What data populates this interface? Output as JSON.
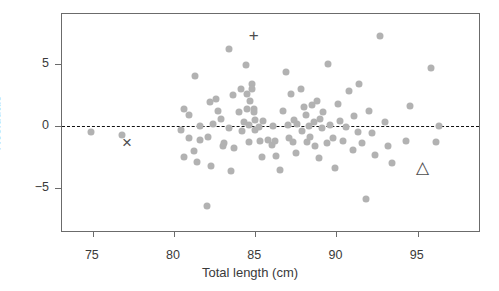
{
  "chart_data": {
    "type": "scatter",
    "title": "",
    "xlabel": "Total length (cm)",
    "ylabel": "Residuals",
    "xlim": [
      73.1,
      98.9
    ],
    "ylim": [
      -8.6,
      9.0
    ],
    "xticks": [
      75,
      80,
      85,
      90,
      95
    ],
    "xticklabels": [
      "75",
      "80",
      "85",
      "90",
      "95"
    ],
    "yticks": [
      5,
      0,
      -5
    ],
    "yticklabels": [
      "5",
      "0",
      "−5"
    ],
    "grid": false,
    "legend": null,
    "reference_lines": [
      {
        "name": "zero-residual-line",
        "axis": "y",
        "value": 0,
        "style": "dashed",
        "color": "#111111"
      }
    ],
    "series": [
      {
        "name": "residuals",
        "marker": "circle",
        "color": "#b2b2b2",
        "points": [
          [
            74.9,
            -0.5
          ],
          [
            76.8,
            -0.7
          ],
          [
            80.4,
            -0.3
          ],
          [
            80.6,
            1.4
          ],
          [
            80.6,
            -2.5
          ],
          [
            80.9,
            0.9
          ],
          [
            80.9,
            -1.0
          ],
          [
            81.2,
            -2.0
          ],
          [
            81.3,
            4.0
          ],
          [
            81.4,
            -2.9
          ],
          [
            81.6,
            0.0
          ],
          [
            81.6,
            -1.1
          ],
          [
            82.0,
            -6.4
          ],
          [
            82.1,
            -0.9
          ],
          [
            82.2,
            1.9
          ],
          [
            82.3,
            -3.2
          ],
          [
            82.4,
            0.2
          ],
          [
            82.6,
            2.2
          ],
          [
            82.7,
            1.2
          ],
          [
            82.9,
            0.6
          ],
          [
            83.0,
            -1.6
          ],
          [
            83.1,
            -1.4
          ],
          [
            83.4,
            6.2
          ],
          [
            83.4,
            -0.2
          ],
          [
            83.5,
            -3.6
          ],
          [
            83.6,
            2.5
          ],
          [
            83.7,
            -1.8
          ],
          [
            84.0,
            1.1
          ],
          [
            84.1,
            3.0
          ],
          [
            84.2,
            -0.4
          ],
          [
            84.3,
            0.3
          ],
          [
            84.4,
            4.9
          ],
          [
            84.5,
            2.6
          ],
          [
            84.5,
            1.4
          ],
          [
            84.6,
            0.1
          ],
          [
            84.6,
            -1.3
          ],
          [
            84.7,
            2.0
          ],
          [
            84.8,
            3.4
          ],
          [
            84.8,
            3.0
          ],
          [
            84.9,
            1.4
          ],
          [
            84.9,
            1.1
          ],
          [
            85.0,
            0.5
          ],
          [
            85.0,
            -0.3
          ],
          [
            85.2,
            -0.1
          ],
          [
            85.3,
            -1.2
          ],
          [
            85.4,
            -2.5
          ],
          [
            85.5,
            0.4
          ],
          [
            85.8,
            -1.1
          ],
          [
            86.0,
            -1.5
          ],
          [
            86.1,
            0.0
          ],
          [
            86.2,
            -1.2
          ],
          [
            86.3,
            -2.4
          ],
          [
            86.5,
            -3.5
          ],
          [
            86.7,
            1.2
          ],
          [
            86.9,
            4.3
          ],
          [
            87.0,
            0.1
          ],
          [
            87.1,
            -1.0
          ],
          [
            87.2,
            2.6
          ],
          [
            87.3,
            -1.3
          ],
          [
            87.4,
            0.5
          ],
          [
            87.5,
            -2.2
          ],
          [
            87.6,
            0.2
          ],
          [
            87.8,
            3.0
          ],
          [
            87.9,
            -0.4
          ],
          [
            88.0,
            1.5
          ],
          [
            88.1,
            0.9
          ],
          [
            88.2,
            -1.3
          ],
          [
            88.3,
            0.0
          ],
          [
            88.4,
            -0.9
          ],
          [
            88.5,
            1.7
          ],
          [
            88.6,
            0.3
          ],
          [
            88.7,
            -1.6
          ],
          [
            88.8,
            2.0
          ],
          [
            88.9,
            -2.6
          ],
          [
            89.0,
            0.6
          ],
          [
            89.1,
            -0.2
          ],
          [
            89.2,
            1.1
          ],
          [
            89.4,
            -1.4
          ],
          [
            89.5,
            5.0
          ],
          [
            89.6,
            0.1
          ],
          [
            89.8,
            -1.0
          ],
          [
            89.9,
            -3.4
          ],
          [
            90.1,
            1.8
          ],
          [
            90.2,
            0.4
          ],
          [
            90.4,
            -1.2
          ],
          [
            90.6,
            -0.1
          ],
          [
            90.8,
            2.8
          ],
          [
            91.0,
            -1.9
          ],
          [
            91.1,
            0.8
          ],
          [
            91.3,
            -0.5
          ],
          [
            91.4,
            3.4
          ],
          [
            91.6,
            -1.4
          ],
          [
            91.8,
            -5.9
          ],
          [
            92.0,
            1.2
          ],
          [
            92.2,
            -0.6
          ],
          [
            92.4,
            -2.3
          ],
          [
            92.7,
            7.2
          ],
          [
            93.0,
            0.3
          ],
          [
            93.2,
            -1.6
          ],
          [
            93.4,
            -3.0
          ],
          [
            94.3,
            -1.2
          ],
          [
            94.5,
            1.6
          ],
          [
            95.8,
            4.7
          ],
          [
            96.1,
            -1.3
          ],
          [
            96.3,
            0.0
          ]
        ]
      }
    ],
    "annotated_markers": [
      {
        "name": "plus-marker",
        "glyph": "+",
        "x": 84.9,
        "y": 7.3,
        "color": "#4d4d4d"
      },
      {
        "name": "cross-marker",
        "glyph": "×",
        "x": 77.1,
        "y": -1.3,
        "color": "#4d4d4d"
      },
      {
        "name": "triangle-marker",
        "glyph": "△",
        "x": 95.3,
        "y": -3.3,
        "color": "#4d4d4d"
      }
    ]
  }
}
